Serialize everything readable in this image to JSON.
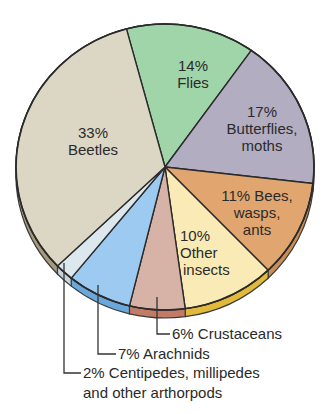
{
  "chart_data": {
    "type": "pie",
    "title": "",
    "start_angle_deg": 345,
    "direction": "clockwise",
    "slices": [
      {
        "label": "Flies",
        "value": 14,
        "display": "14%",
        "color": "#9fd5a8"
      },
      {
        "label": "Butterflies, moths",
        "value": 17,
        "display": "17%",
        "color": "#b3adc2"
      },
      {
        "label": "Bees, wasps, ants",
        "value": 11,
        "display": "11%",
        "color": "#e1a670"
      },
      {
        "label": "Other insects",
        "value": 10,
        "display": "10%",
        "color": "#faeab5"
      },
      {
        "label": "Crustaceans",
        "value": 6,
        "display": "6%",
        "color": "#d6b3a6"
      },
      {
        "label": "Arachnids",
        "value": 7,
        "display": "7%",
        "color": "#9ccaf0"
      },
      {
        "label": "Centipedes, millipedes and other arthorpods",
        "value": 2,
        "display": "2%",
        "color": "#dde8ee"
      },
      {
        "label": "Beetles",
        "value": 33,
        "display": "33%",
        "color": "#dcd7c4"
      }
    ],
    "rim_colors": [
      "#8fbf98",
      "#9d97ad",
      "#c98d55",
      "#e2b93a",
      "#c27b66",
      "#6aa8dc",
      "#c8d3da",
      "#a69a7c"
    ]
  },
  "labels": {
    "flies": {
      "pct": "14%",
      "name": "Flies"
    },
    "butterflies": {
      "pct": "17%",
      "name1": "Butterflies,",
      "name2": "moths"
    },
    "bees": {
      "line1": "11% Bees,",
      "line2": "wasps,",
      "line3": "ants"
    },
    "other": {
      "pct": "10%",
      "name1": "Other",
      "name2": "insects"
    },
    "beetles": {
      "pct": "33%",
      "name": "Beetles"
    },
    "crustaceans": "6% Crustaceans",
    "arachnids": "7% Arachnids",
    "centipedes_line1": "2% Centipedes, millipedes",
    "centipedes_line2": "and other arthorpods"
  }
}
